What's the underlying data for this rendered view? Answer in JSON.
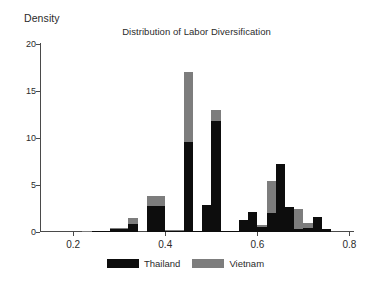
{
  "chart_data": {
    "type": "bar",
    "title": "Distribution of Labor Diversification",
    "xlabel": "",
    "ylabel": "Density",
    "xlim": [
      0.13,
      0.81
    ],
    "ylim": [
      0,
      20
    ],
    "grid": false,
    "legend_position": "bottom-center",
    "bin_width": 0.02,
    "x_ticks": [
      0.2,
      0.4,
      0.6,
      0.8
    ],
    "x_tick_labels": [
      "0.2",
      "0.4",
      "0.6",
      "0.8"
    ],
    "y_ticks": [
      0,
      5,
      10,
      15,
      20
    ],
    "y_tick_labels": [
      "0",
      "5",
      "10",
      "15",
      "20"
    ],
    "colors": {
      "thailand": "#0d0d0d",
      "vietnam": "#7d7d7d",
      "axis": "#4a4a4a",
      "text": "#2b2b2b",
      "background": "#ffffff"
    },
    "series": [
      {
        "name": "Thailand",
        "color": "#0d0d0d",
        "values": [
          0.0,
          0.15,
          0.15,
          0.0,
          0.35,
          0.35,
          0.0,
          0.9,
          0.9,
          0.0,
          2.8,
          2.8,
          0.15,
          0.15,
          0.15,
          9.6,
          9.6,
          0.1,
          2.9,
          2.9,
          11.8,
          11.8,
          0.1,
          0.1,
          1.3,
          2.1,
          2.1,
          0.55,
          2.0,
          2.0,
          7.2,
          7.2,
          2.7,
          2.7,
          0.3,
          0.3,
          0.45,
          1.6,
          1.6,
          0.3,
          0.0,
          0.0
        ]
      },
      {
        "name": "Vietnam",
        "color": "#7d7d7d",
        "values": [
          0.1,
          0.15,
          0.15,
          0.0,
          0.4,
          0.4,
          0.0,
          1.5,
          1.5,
          0.0,
          3.8,
          3.8,
          0.25,
          0.25,
          0.25,
          17.0,
          17.0,
          0.1,
          0.0,
          0.0,
          13.0,
          13.0,
          0.1,
          0.1,
          0.0,
          0.0,
          0.0,
          0.7,
          5.4,
          5.4,
          0.0,
          0.0,
          0.0,
          0.0,
          2.4,
          2.4,
          1.0,
          0.0,
          0.0,
          0.0,
          0.0,
          0.0
        ]
      }
    ],
    "bins": [
      {
        "x0": 0.22,
        "thailand": 0.0,
        "vietnam": 0.1
      },
      {
        "x0": 0.24,
        "thailand": 0.15,
        "vietnam": 0.15
      },
      {
        "x0": 0.26,
        "thailand": 0.15,
        "vietnam": 0.15
      },
      {
        "x0": 0.28,
        "thailand": 0.35,
        "vietnam": 0.4
      },
      {
        "x0": 0.3,
        "thailand": 0.35,
        "vietnam": 0.4
      },
      {
        "x0": 0.32,
        "thailand": 0.9,
        "vietnam": 1.5
      },
      {
        "x0": 0.34,
        "thailand": 0.0,
        "vietnam": 0.0
      },
      {
        "x0": 0.36,
        "thailand": 2.8,
        "vietnam": 3.8
      },
      {
        "x0": 0.38,
        "thailand": 2.8,
        "vietnam": 3.8
      },
      {
        "x0": 0.4,
        "thailand": 0.15,
        "vietnam": 0.25
      },
      {
        "x0": 0.42,
        "thailand": 0.15,
        "vietnam": 0.25
      },
      {
        "x0": 0.44,
        "thailand": 9.6,
        "vietnam": 17.0
      },
      {
        "x0": 0.46,
        "thailand": 0.1,
        "vietnam": 0.1
      },
      {
        "x0": 0.48,
        "thailand": 2.9,
        "vietnam": 0.0
      },
      {
        "x0": 0.5,
        "thailand": 11.8,
        "vietnam": 13.0
      },
      {
        "x0": 0.52,
        "thailand": 0.1,
        "vietnam": 0.1
      },
      {
        "x0": 0.54,
        "thailand": 0.1,
        "vietnam": 0.1
      },
      {
        "x0": 0.56,
        "thailand": 1.3,
        "vietnam": 0.0
      },
      {
        "x0": 0.58,
        "thailand": 2.1,
        "vietnam": 0.0
      },
      {
        "x0": 0.6,
        "thailand": 0.55,
        "vietnam": 0.7
      },
      {
        "x0": 0.62,
        "thailand": 2.0,
        "vietnam": 5.4
      },
      {
        "x0": 0.64,
        "thailand": 7.2,
        "vietnam": 0.0
      },
      {
        "x0": 0.66,
        "thailand": 2.7,
        "vietnam": 0.0
      },
      {
        "x0": 0.68,
        "thailand": 0.3,
        "vietnam": 2.4
      },
      {
        "x0": 0.7,
        "thailand": 0.45,
        "vietnam": 1.0
      },
      {
        "x0": 0.72,
        "thailand": 1.6,
        "vietnam": 0.0
      },
      {
        "x0": 0.74,
        "thailand": 0.3,
        "vietnam": 0.0
      }
    ]
  },
  "legend": {
    "entries": [
      {
        "label": "Thailand",
        "color": "#0d0d0d",
        "swatch_name": "legend-swatch-thailand"
      },
      {
        "label": "Vietnam",
        "color": "#7d7d7d",
        "swatch_name": "legend-swatch-vietnam"
      }
    ]
  }
}
